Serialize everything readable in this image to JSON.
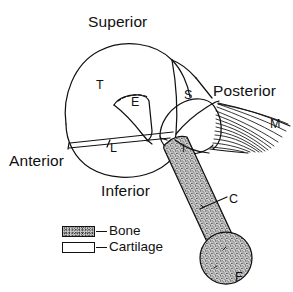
{
  "figure": {
    "type": "anatomical-line-diagram",
    "background_color": "#ffffff",
    "line_color": "#111111"
  },
  "orientation_labels": {
    "superior": "Superior",
    "inferior": "Inferior",
    "anterior": "Anterior",
    "posterior": "Posterior"
  },
  "part_labels": [
    {
      "key": "T",
      "text": "T"
    },
    {
      "key": "E",
      "text": "E"
    },
    {
      "key": "L",
      "text": "L"
    },
    {
      "key": "S",
      "text": "S"
    },
    {
      "key": "M",
      "text": "M"
    },
    {
      "key": "I",
      "text": "I"
    },
    {
      "key": "C",
      "text": "C"
    },
    {
      "key": "F",
      "text": "F"
    }
  ],
  "legend": {
    "items": [
      {
        "label": "Bone",
        "swatch": "stippled",
        "dash": "–"
      },
      {
        "label": "Cartilage",
        "swatch": "white",
        "dash": "–"
      }
    ]
  }
}
